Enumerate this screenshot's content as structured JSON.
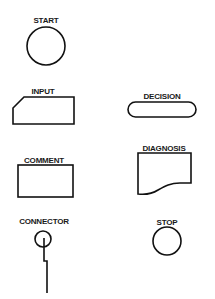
{
  "diagram": {
    "type": "flowchart-symbol-legend",
    "background": "#ffffff",
    "stroke_color": "#111111",
    "symbols": [
      {
        "id": "start",
        "label": "START",
        "shape": "circle"
      },
      {
        "id": "input",
        "label": "INPUT",
        "shape": "chamfered-rectangle"
      },
      {
        "id": "decision",
        "label": "DECISION",
        "shape": "rounded-pill"
      },
      {
        "id": "comment",
        "label": "COMMENT",
        "shape": "rectangle"
      },
      {
        "id": "diagnosis",
        "label": "DIAGNOSIS",
        "shape": "document-wavy-bottom"
      },
      {
        "id": "connector",
        "label": "CONNECTOR",
        "shape": "small-circle-with-line"
      },
      {
        "id": "stop",
        "label": "STOP",
        "shape": "circle"
      }
    ]
  }
}
